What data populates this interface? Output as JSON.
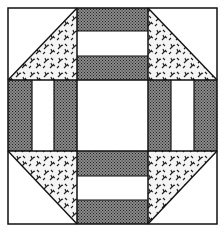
{
  "figure": {
    "title": "",
    "colors": {
      "dark_fabric": "#6a6a6a",
      "light_fabric": "#ffffff",
      "outline": "#111111",
      "print_bg": "#f4f4f4",
      "print_motif": "#222222"
    },
    "grid": {
      "cols_px": [
        8,
        77,
        148,
        217
      ],
      "rows_px": [
        8,
        80,
        151,
        224
      ]
    },
    "cells": [
      {
        "pos": "top-left",
        "type": "half-square-triangle",
        "print_half": "bottom-right"
      },
      {
        "pos": "top-center",
        "type": "horizontal-stripes",
        "stripes": [
          "dark",
          "light",
          "dark"
        ]
      },
      {
        "pos": "top-right",
        "type": "half-square-triangle",
        "print_half": "bottom-left"
      },
      {
        "pos": "middle-left",
        "type": "vertical-stripes",
        "stripes": [
          "dark",
          "light",
          "dark"
        ]
      },
      {
        "pos": "center",
        "type": "plain",
        "fabric": "light"
      },
      {
        "pos": "middle-right",
        "type": "vertical-stripes",
        "stripes": [
          "dark",
          "light",
          "dark"
        ]
      },
      {
        "pos": "bottom-left",
        "type": "half-square-triangle",
        "print_half": "top-right"
      },
      {
        "pos": "bottom-center",
        "type": "horizontal-stripes",
        "stripes": [
          "dark",
          "light",
          "dark"
        ]
      },
      {
        "pos": "bottom-right",
        "type": "half-square-triangle",
        "print_half": "top-left"
      }
    ]
  }
}
